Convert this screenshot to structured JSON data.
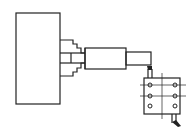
{
  "diagram": {
    "type": "lathe-setup-schematic",
    "background": "#ffffff",
    "stroke_color": "#222222",
    "components": [
      {
        "name": "headstock",
        "shape": "rectangle"
      },
      {
        "name": "chuck",
        "shape": "stepped-jaws"
      },
      {
        "name": "workpiece-large-diameter",
        "shape": "rectangle"
      },
      {
        "name": "workpiece-small-diameter",
        "shape": "rectangle"
      },
      {
        "name": "cutting-tool-upper",
        "shape": "tool-tip"
      },
      {
        "name": "tool-holder",
        "shape": "rectangle-with-holes",
        "holes": 6
      },
      {
        "name": "cutting-tool-lower",
        "shape": "tool-tip"
      }
    ],
    "labels": []
  }
}
